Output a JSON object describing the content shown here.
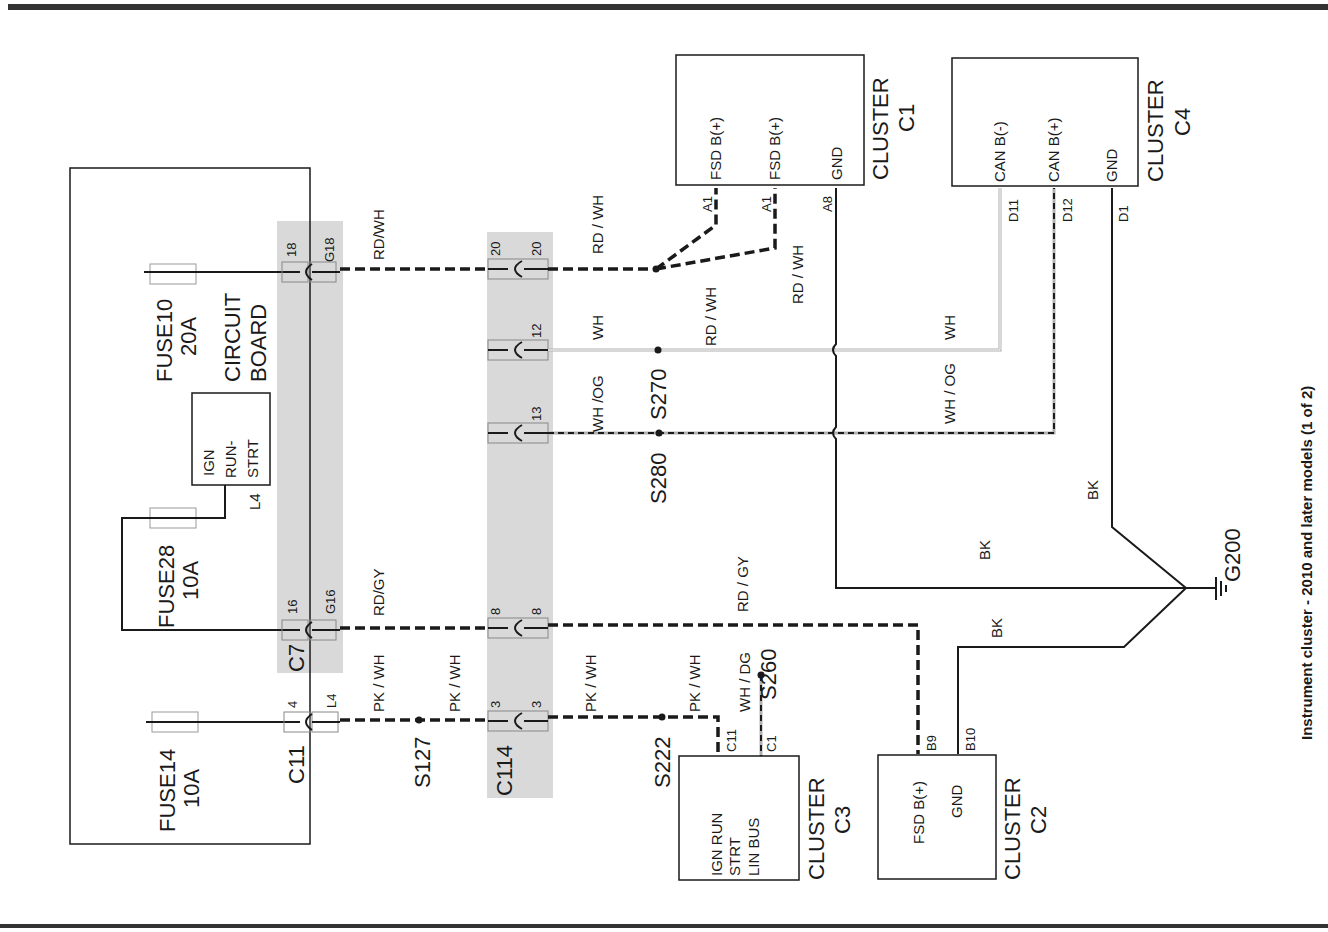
{
  "title": "Instrument cluster - 2010 and later models (1 of 2)",
  "circuit_board": {
    "label_line1": "CIRCUIT",
    "label_line2": "BOARD",
    "fuses": [
      {
        "name": "FUSE10",
        "rating": "20A"
      },
      {
        "name": "FUSE28",
        "rating": "10A"
      },
      {
        "name": "FUSE14",
        "rating": "10A"
      }
    ],
    "relay": {
      "line1": "IGN",
      "line2": "RUN-",
      "line3": "STRT",
      "pin": "L4"
    }
  },
  "connectors": {
    "c7": {
      "name": "C7",
      "pins": [
        {
          "in": "18",
          "out": "G18"
        },
        {
          "in": "16",
          "out": "G16"
        }
      ]
    },
    "c11": {
      "name": "C11",
      "pins": [
        {
          "in": "4",
          "out": "L4"
        }
      ]
    },
    "c114": {
      "name": "C114",
      "pins": [
        {
          "in": "20",
          "out": "20"
        },
        {
          "in": "12",
          "out": "12"
        },
        {
          "in": "13",
          "out": "13"
        },
        {
          "in": "8",
          "out": "8"
        },
        {
          "in": "3",
          "out": "3"
        }
      ]
    }
  },
  "wires": {
    "rdwh_1": "RD/WH",
    "rdwh_2": "RD / WH",
    "rdwh_3": "RD / WH",
    "rdwh_4": "RD / WH",
    "wh_1": "WH",
    "wh_2": "WH",
    "whog_1": "WH /OG",
    "whog_2": "WH / OG",
    "rdgy_1": "RD/GY",
    "rdgy_2": "RD / GY",
    "pkwh_1": "PK / WH",
    "pkwh_2": "PK / WH",
    "pkwh_3": "PK / WH",
    "pkwh_4": "PK / WH",
    "whdg": "WH / DG",
    "bk_1": "BK",
    "bk_2": "BK",
    "bk_3": "BK"
  },
  "splices": {
    "s270": "S270",
    "s280": "S280",
    "s127": "S127",
    "s222": "S222",
    "s260": "S260"
  },
  "ground": "G200",
  "clusters": {
    "c1": {
      "label": "CLUSTER",
      "id": "C1",
      "pins": [
        {
          "name": "FSD B(+)",
          "pin": "A1"
        },
        {
          "name": "FSD B(+)",
          "pin": "A1"
        },
        {
          "name": "GND",
          "pin": "A8"
        }
      ]
    },
    "c4": {
      "label": "CLUSTER",
      "id": "C4",
      "pins": [
        {
          "name": "CAN B(-)",
          "pin": "D11"
        },
        {
          "name": "CAN B(+)",
          "pin": "D12"
        },
        {
          "name": "GND",
          "pin": "D1"
        }
      ]
    },
    "c3": {
      "label": "CLUSTER",
      "id": "C3",
      "pins": [
        {
          "name": "IGN RUN",
          "pin": "C11"
        },
        {
          "name": "STRT",
          "pin": ""
        },
        {
          "name": "LIN BUS",
          "pin": "C1"
        }
      ]
    },
    "c2": {
      "label": "CLUSTER",
      "id": "C2",
      "pins": [
        {
          "name": "FSD B(+)",
          "pin": "B9"
        },
        {
          "name": "GND",
          "pin": "B10"
        }
      ]
    }
  }
}
